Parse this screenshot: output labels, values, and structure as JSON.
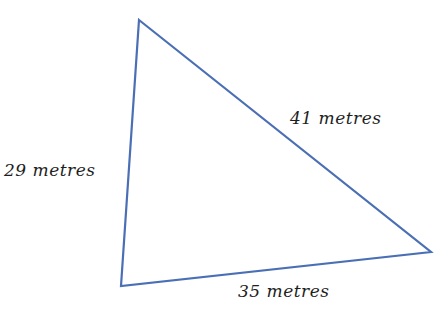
{
  "diagram": {
    "type": "triangle",
    "stroke_color": "#4a6fb5",
    "label_color": "#1e1e1e",
    "vertices": {
      "top": [
        139,
        20
      ],
      "bottom_left": [
        121,
        286
      ],
      "right": [
        431,
        252
      ]
    },
    "sides": [
      {
        "id": "left",
        "label": "29 metres",
        "length": 29
      },
      {
        "id": "hypotenuse",
        "label": "41 metres",
        "length": 41
      },
      {
        "id": "bottom",
        "label": "35 metres",
        "length": 35
      }
    ]
  }
}
